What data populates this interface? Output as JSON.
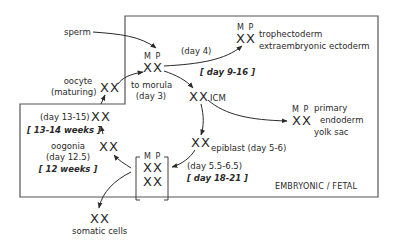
{
  "diagram": {
    "region_label": "EMBRYONIC / FETAL",
    "nodes": {
      "sperm": {
        "label": "sperm"
      },
      "oocyte": {
        "label_line1": "oocyte",
        "label_line2": "(maturing)",
        "chromosomes": "XX"
      },
      "zygote": {
        "parental": "M P",
        "chromosomes": "XX",
        "note_line1": "to morula",
        "note_line2": "(day 3)"
      },
      "trophectoderm": {
        "parental": "M P",
        "chromosomes": "XX",
        "label_line1": "trophectoderm",
        "label_line2": "extraembryonic ectoderm",
        "edge_label": "(day 4)",
        "human_timing": "[ day 9-16 ]"
      },
      "icm": {
        "chromosomes": "XX",
        "label": "ICM"
      },
      "primary_endoderm": {
        "parental": "M P",
        "chromosomes": "XX",
        "label_line1": "primary",
        "label_line2": "endoderm",
        "label_line3": "yolk sac"
      },
      "epiblast": {
        "chromosomes": "XX",
        "label": "epiblast (day 5-6)"
      },
      "random_x": {
        "parental": "M P",
        "chromosomes_line1": "XX",
        "chromosomes_line2": "XX",
        "edge_label": "(day 5.5-6.5)",
        "human_timing": "[ day 18-21 ]"
      },
      "oogonia": {
        "chromosomes": "XX",
        "label": "oogonia",
        "timing": "(day 12.5)",
        "human_timing": "[ 12 weeks ]"
      },
      "oocyte_early": {
        "chromosomes": "XX",
        "timing": "(day 13-15)",
        "human_timing": "[ 13-14 weeks ]"
      },
      "somatic": {
        "chromosomes": "XX",
        "label": "somatic cells"
      }
    }
  }
}
